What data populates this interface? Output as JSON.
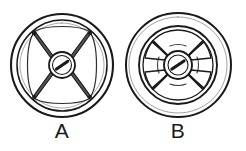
{
  "figure": {
    "kind": "line-drawing",
    "background_color": "#ffffff",
    "ink_color": "#1a1a1a",
    "items": [
      {
        "id": "wheel-a",
        "label": "A",
        "type": "thin-rim-spoked-wheel",
        "center_x": 62,
        "center_y": 65,
        "outer_radius": 51,
        "rim_inner_radius": 45,
        "hub_radius": 13,
        "hub_inner_radius": 10,
        "spoke_count": 4,
        "spoke_angles_deg": [
          45,
          135,
          225,
          315
        ],
        "has_center_slot": true,
        "slot_angle_deg": 30,
        "rim_style": "thin double line",
        "spoke_style": "thin straight tapered",
        "rim_nodes": true
      },
      {
        "id": "wheel-b",
        "label": "B",
        "type": "thick-rim-spoked-wheel",
        "center_x": 178,
        "center_y": 65,
        "outer_radius": 52,
        "rim_inner_radius": 38,
        "inner_ring_radius": 34,
        "hub_radius": 14,
        "hub_inner_radius": 11,
        "spoke_count": 4,
        "spoke_angles_deg": [
          45,
          135,
          225,
          315
        ],
        "has_center_slot": true,
        "slot_angle_deg": 30,
        "rim_style": "thick solid band",
        "spoke_style": "thick tapered webbed",
        "rim_nodes": false
      }
    ]
  },
  "labels": {
    "a": "A",
    "b": "B"
  }
}
